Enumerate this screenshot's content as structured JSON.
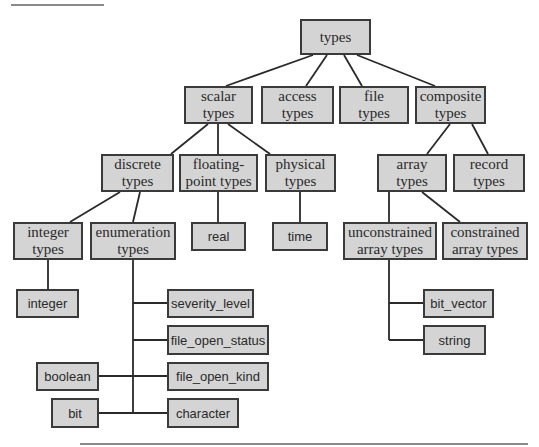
{
  "diagram": {
    "colors": {
      "node_fill": "#d4d4d4",
      "node_border": "#3a3a3a",
      "edge": "#2a2a2a",
      "rule": "#8a8a8a"
    },
    "nodes": [
      {
        "id": "types",
        "label": "types",
        "font": "serif",
        "x": 300,
        "y": 19,
        "w": 71,
        "h": 36
      },
      {
        "id": "scalar",
        "label": "scalar\ntypes",
        "font": "serif",
        "x": 184,
        "y": 86,
        "w": 69,
        "h": 38
      },
      {
        "id": "access",
        "label": "access\ntypes",
        "font": "serif",
        "x": 261,
        "y": 86,
        "w": 73,
        "h": 38
      },
      {
        "id": "file",
        "label": "file\ntypes",
        "font": "serif",
        "x": 339,
        "y": 86,
        "w": 70,
        "h": 38
      },
      {
        "id": "composite",
        "label": "composite\ntypes",
        "font": "serif",
        "x": 415,
        "y": 86,
        "w": 71,
        "h": 38
      },
      {
        "id": "discrete",
        "label": "discrete\ntypes",
        "font": "serif",
        "x": 101,
        "y": 154,
        "w": 73,
        "h": 38
      },
      {
        "id": "floating",
        "label": "floating-\npoint types",
        "font": "serif",
        "x": 179,
        "y": 154,
        "w": 79,
        "h": 38
      },
      {
        "id": "physical",
        "label": "physical\ntypes",
        "font": "serif",
        "x": 265,
        "y": 154,
        "w": 71,
        "h": 38
      },
      {
        "id": "array",
        "label": "array\ntypes",
        "font": "serif",
        "x": 377,
        "y": 154,
        "w": 70,
        "h": 38
      },
      {
        "id": "record",
        "label": "record\ntypes",
        "font": "serif",
        "x": 453,
        "y": 154,
        "w": 72,
        "h": 38
      },
      {
        "id": "integer_types",
        "label": "integer\ntypes",
        "font": "serif",
        "x": 13,
        "y": 222,
        "w": 70,
        "h": 38
      },
      {
        "id": "enumeration",
        "label": "enumeration\ntypes",
        "font": "serif",
        "x": 90,
        "y": 222,
        "w": 86,
        "h": 38
      },
      {
        "id": "real",
        "label": "real",
        "font": "sans",
        "x": 191,
        "y": 222,
        "w": 55,
        "h": 29
      },
      {
        "id": "time",
        "label": "time",
        "font": "sans",
        "x": 272,
        "y": 222,
        "w": 56,
        "h": 29
      },
      {
        "id": "unconstrained",
        "label": "unconstrained\narray types",
        "font": "serif",
        "x": 343,
        "y": 222,
        "w": 94,
        "h": 38
      },
      {
        "id": "constrained",
        "label": "constrained\narray types",
        "font": "serif",
        "x": 442,
        "y": 222,
        "w": 86,
        "h": 38
      },
      {
        "id": "integer",
        "label": "integer",
        "font": "sans",
        "x": 16,
        "y": 289,
        "w": 63,
        "h": 29
      },
      {
        "id": "severity_level",
        "label": "severity_level",
        "font": "sans",
        "x": 167,
        "y": 289,
        "w": 87,
        "h": 29
      },
      {
        "id": "file_open_status",
        "label": "file_open_status",
        "font": "sans",
        "x": 167,
        "y": 325,
        "w": 102,
        "h": 30
      },
      {
        "id": "boolean",
        "label": "boolean",
        "font": "sans",
        "x": 36,
        "y": 362,
        "w": 63,
        "h": 29
      },
      {
        "id": "file_open_kind",
        "label": "file_open_kind",
        "font": "sans",
        "x": 167,
        "y": 362,
        "w": 102,
        "h": 29
      },
      {
        "id": "bit",
        "label": "bit",
        "font": "sans",
        "x": 51,
        "y": 398,
        "w": 48,
        "h": 30
      },
      {
        "id": "character",
        "label": "character",
        "font": "sans",
        "x": 167,
        "y": 398,
        "w": 72,
        "h": 30
      },
      {
        "id": "bit_vector",
        "label": "bit_vector",
        "font": "sans",
        "x": 423,
        "y": 289,
        "w": 71,
        "h": 29
      },
      {
        "id": "string",
        "label": "string",
        "font": "sans",
        "x": 423,
        "y": 325,
        "w": 63,
        "h": 30
      }
    ],
    "edges": [
      [
        313,
        55,
        226,
        86
      ],
      [
        327,
        55,
        306,
        86
      ],
      [
        344,
        55,
        362,
        86
      ],
      [
        357,
        55,
        435,
        86
      ],
      [
        208,
        124,
        171,
        154
      ],
      [
        218,
        124,
        218,
        154
      ],
      [
        228,
        124,
        270,
        154
      ],
      [
        450,
        124,
        427,
        154
      ],
      [
        472,
        124,
        488,
        154
      ],
      [
        120,
        192,
        70,
        222
      ],
      [
        140,
        192,
        133,
        222
      ],
      [
        218,
        192,
        218,
        222
      ],
      [
        300,
        192,
        300,
        222
      ],
      [
        389,
        192,
        389,
        222
      ],
      [
        422,
        192,
        460,
        222
      ],
      [
        48,
        260,
        48,
        289
      ],
      [
        133,
        260,
        133,
        413
      ],
      [
        133,
        303,
        167,
        303
      ],
      [
        133,
        340,
        167,
        340
      ],
      [
        99,
        376,
        167,
        376
      ],
      [
        99,
        413,
        167,
        413
      ],
      [
        389,
        260,
        389,
        340
      ],
      [
        389,
        303,
        423,
        303
      ],
      [
        389,
        340,
        423,
        340
      ]
    ],
    "rules": [
      {
        "x": 11,
        "y": 4,
        "w": 93
      },
      {
        "x": 80,
        "y": 443,
        "w": 448
      }
    ]
  }
}
